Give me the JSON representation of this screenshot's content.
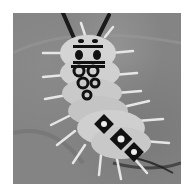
{
  "image": {
    "subject": "spiny caterpillar",
    "style": "grayscale photograph",
    "colors": {
      "border": "#ffffff",
      "background_surface": "#848484",
      "body": "#d9d9d9",
      "markings": "#111111",
      "spines": "#e6e6e6",
      "antennae": "#1a1a1a"
    }
  }
}
